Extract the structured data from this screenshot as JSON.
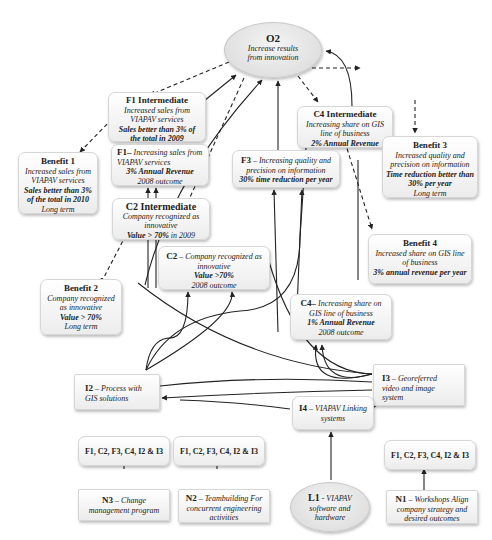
{
  "objective": {
    "id": "O2",
    "text": "Increase results from innovation"
  },
  "intermediates": {
    "f1": {
      "title": "F1 Intermediate",
      "desc": "Increased sales from VIAPAV services",
      "target": "Sales better than 3% of the total in 2009"
    },
    "c2": {
      "title": "C2 Intermediate",
      "desc": "Company recognized as innovative",
      "target_bold": "Value > 70%",
      "target_rest": " in 2009"
    },
    "c4": {
      "title": "C4 Intermediate",
      "desc": "Increasing share on GIS line of business",
      "target": "2% Annual Revenue"
    }
  },
  "benefits": {
    "b1": {
      "title": "Benefit 1",
      "desc": "Increased sales from VIAPAV services",
      "target": "Sales better than 3% of the total in 2010",
      "term": "Long term"
    },
    "b2": {
      "title": "Benefit 2",
      "desc": "Company recognized as innovative",
      "target": "Value > 70%",
      "term": "Long term"
    },
    "b3": {
      "title": "Benefit 3",
      "desc": "Increased quality and precision on information",
      "target": "Time reduction better than 30% per year",
      "term": "Long term"
    },
    "b4": {
      "title": "Benefit 4",
      "desc": "Increased share on GIS line of business",
      "target": "3% annual revenue per year"
    }
  },
  "outcomes": {
    "f1": {
      "id": "F1–",
      "desc": "Increasing sales from VIAPAV services",
      "target": "3% Annual Revenue",
      "outcome": "2008 outcome"
    },
    "f3": {
      "id": "F3",
      "sep": " – ",
      "desc": "Increasing quality and precision on information",
      "target": "30% time reduction per year"
    },
    "c2": {
      "id": "C2",
      "sep": " – ",
      "desc": "Company recognized as innovative",
      "target": "Value >70%",
      "outcome": "2008 outcome"
    },
    "c4": {
      "id": "C4–",
      "desc": " Increasing share on GIS line of business",
      "target": "1% Annual Revenue",
      "outcome": "2008 outcome"
    }
  },
  "enablers": {
    "i2": {
      "id": "I2",
      "sep": " – ",
      "desc": "Process with GIS solutions"
    },
    "i3": {
      "id": "I3",
      "sep": " – ",
      "desc": "Georeferred video and image system"
    },
    "i4": {
      "id": "I4",
      "sep": " – ",
      "desc": "VIAPAV Linking systems"
    }
  },
  "targets_label": "F1, C2, F3, C4, I2 & I3",
  "initiatives": {
    "n3": {
      "id": "N3",
      "sep": " – ",
      "desc": "Change management program"
    },
    "n2": {
      "id": "N2",
      "sep": " – ",
      "desc": "Teambuilding For concurrent engineering activities"
    },
    "l1": {
      "id": "L1",
      "sep": " - ",
      "desc": "VIAPAV software and hardware"
    },
    "n1": {
      "id": "N1",
      "sep": " – ",
      "desc": "Workshops Align company strategy and desired outcomes"
    }
  },
  "colors": {
    "line": "#222222",
    "box_border": "#d6d6d6",
    "box_fill": "#f2f2f2",
    "oval_fill": "#e2e2e2"
  }
}
